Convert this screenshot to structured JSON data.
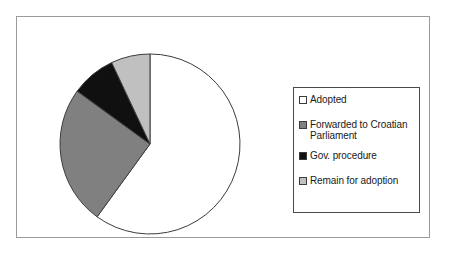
{
  "chart_data": {
    "type": "pie",
    "title": "",
    "categories": [
      "Adopted",
      "Forwarded to Croatian Parliament",
      "Gov. procedure",
      "Remain for adoption"
    ],
    "values": [
      60,
      25,
      8,
      7
    ],
    "unit": "%",
    "start_angle_deg": 0,
    "direction": "clockwise",
    "colors": [
      "#ffffff",
      "#808080",
      "#101010",
      "#c0c0c0"
    ],
    "slice_borders": "#3c3c3c",
    "legend_position": "right",
    "grid": false,
    "data_labels_shown": false,
    "slices": [
      {
        "label": "Adopted",
        "value": 60,
        "color": "#ffffff",
        "start_deg": 0,
        "end_deg": 216
      },
      {
        "label": "Forwarded to Croatian\nParliament",
        "value": 25,
        "color": "#808080",
        "start_deg": 216,
        "end_deg": 306
      },
      {
        "label": "Gov. procedure",
        "value": 8,
        "color": "#101010",
        "start_deg": 306,
        "end_deg": 334.8
      },
      {
        "label": "Remain for adoption",
        "value": 7,
        "color": "#c0c0c0",
        "start_deg": 334.8,
        "end_deg": 360
      }
    ]
  },
  "legend": {
    "items": [
      {
        "label": "Adopted",
        "color": "#ffffff"
      },
      {
        "label": "Forwarded to Croatian\nParliament",
        "color": "#808080"
      },
      {
        "label": "Gov. procedure",
        "color": "#101010"
      },
      {
        "label": "Remain for adoption",
        "color": "#c0c0c0"
      }
    ]
  },
  "frame": {
    "border_color": "#9a9a9a",
    "background": "#ffffff"
  }
}
